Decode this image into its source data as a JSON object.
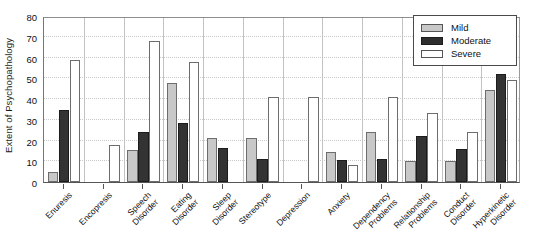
{
  "chart_data": {
    "type": "bar",
    "title": "",
    "xlabel": "",
    "ylabel": "Extent of Psychopathology",
    "ylim": [
      0,
      80
    ],
    "yticks": [
      0,
      10,
      20,
      30,
      40,
      50,
      60,
      70,
      80
    ],
    "grid": true,
    "legend_position": "top-right",
    "categories": [
      "Enuresis",
      "Encopresis",
      "Speech Disorder",
      "Eating Disorder",
      "Sleep Disorder",
      "Stereotype",
      "Depression",
      "Anxiety",
      "Dependency Problems",
      "Relationship Problems",
      "Conduct Disorder",
      "Hyperkinetic Disorder"
    ],
    "category_lines": [
      [
        "Enuresis",
        ""
      ],
      [
        "Encopresis",
        ""
      ],
      [
        "Speech",
        "Disorder"
      ],
      [
        "Eating",
        "Disorder"
      ],
      [
        "Sleep",
        "Disorder"
      ],
      [
        "Stereotype",
        ""
      ],
      [
        "Depression",
        ""
      ],
      [
        "Anxiety",
        ""
      ],
      [
        "Dependency",
        "Problems"
      ],
      [
        "Relationship",
        "Problems"
      ],
      [
        "Conduct",
        "Disorder"
      ],
      [
        "Hyperkinetic",
        "Disorder"
      ]
    ],
    "series": [
      {
        "name": "Mild",
        "color": "#c8c8c8",
        "values": [
          5,
          0,
          15.5,
          47.5,
          21,
          21,
          0,
          14.5,
          24,
          10,
          10,
          44.5
        ]
      },
      {
        "name": "Moderate",
        "color": "#333333",
        "values": [
          34.5,
          0,
          24,
          28.5,
          16.5,
          11,
          0,
          10.5,
          11,
          22,
          16,
          52
        ]
      },
      {
        "name": "Severe",
        "color": "#ffffff",
        "values": [
          59,
          18,
          68,
          58,
          0,
          41,
          41,
          8,
          41,
          33.5,
          24,
          49
        ]
      }
    ]
  },
  "legend": {
    "items": [
      {
        "label": "Mild",
        "swatch": "mild"
      },
      {
        "label": "Moderate",
        "swatch": "moderate"
      },
      {
        "label": "Severe",
        "swatch": "severe"
      }
    ]
  }
}
